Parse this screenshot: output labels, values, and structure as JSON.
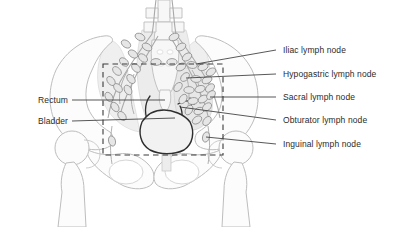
{
  "figure": {
    "type": "anatomical-illustration",
    "region": "male pelvis, anterior view"
  },
  "colors": {
    "bone_stroke": "#b9b9b9",
    "bone_fill": "#fbfbfb",
    "soft_tissue_fill": "#efefef",
    "soft_tissue_stroke": "#c8c8c8",
    "node_stroke": "#8f8f8f",
    "node_fill": "#e4e4e4",
    "vessel_stroke": "#a8a8a8",
    "bladder_stroke": "#2f2f2f",
    "dashed_box": "#3a3a3a",
    "leader_line": "#3a3a3a",
    "label_text": "#2b2b2b",
    "background": "#ffffff"
  },
  "labels_right": [
    {
      "id": "iliac",
      "text": "Iliac lymph node",
      "y": 50,
      "leader_from_x": 276,
      "leader_to_x": 196,
      "leader_to_y": 64
    },
    {
      "id": "hypogastric",
      "text": "Hypogastric lymph node",
      "y": 74,
      "leader_from_x": 276,
      "leader_to_x": 186,
      "leader_to_y": 78
    },
    {
      "id": "sacral",
      "text": "Sacral lymph node",
      "y": 97,
      "leader_from_x": 276,
      "leader_to_x": 210,
      "leader_to_y": 97
    },
    {
      "id": "obturator",
      "text": "Obturator lymph node",
      "y": 120,
      "leader_from_x": 276,
      "leader_to_x": 180,
      "leader_to_y": 107
    },
    {
      "id": "inguinal",
      "text": "Inguinal lymph node",
      "y": 144,
      "leader_from_x": 276,
      "leader_to_x": 206,
      "leader_to_y": 137
    }
  ],
  "labels_left": [
    {
      "id": "rectum",
      "text": "Rectum",
      "y": 100,
      "leader_from_x": 72,
      "leader_to_x": 165,
      "leader_to_y": 100
    },
    {
      "id": "bladder",
      "text": "Bladder",
      "y": 121,
      "leader_from_x": 72,
      "leader_to_x": 175,
      "leader_to_y": 118
    }
  ],
  "dashed_box": {
    "x": 103,
    "y": 64,
    "width": 120,
    "height": 91
  },
  "node_chains": {
    "left_external_iliac": [
      [
        126,
        44
      ],
      [
        131,
        52
      ],
      [
        122,
        60
      ],
      [
        116,
        69
      ],
      [
        110,
        78
      ],
      [
        116,
        86
      ],
      [
        108,
        96
      ],
      [
        113,
        105
      ],
      [
        120,
        114
      ]
    ],
    "left_common_iliac": [
      [
        140,
        36
      ],
      [
        146,
        45
      ],
      [
        150,
        56
      ],
      [
        143,
        66
      ],
      [
        136,
        76
      ],
      [
        130,
        86
      ]
    ],
    "right_common_iliac": [
      [
        174,
        36
      ],
      [
        180,
        46
      ],
      [
        186,
        56
      ],
      [
        192,
        64
      ]
    ],
    "right_cluster": [
      [
        180,
        68
      ],
      [
        189,
        64
      ],
      [
        197,
        70
      ],
      [
        204,
        64
      ],
      [
        186,
        76
      ],
      [
        196,
        80
      ],
      [
        206,
        76
      ],
      [
        212,
        70
      ],
      [
        178,
        86
      ],
      [
        188,
        90
      ],
      [
        198,
        88
      ],
      [
        208,
        86
      ],
      [
        182,
        98
      ],
      [
        192,
        100
      ],
      [
        202,
        98
      ],
      [
        210,
        94
      ],
      [
        188,
        108
      ],
      [
        198,
        110
      ],
      [
        206,
        106
      ],
      [
        196,
        118
      ],
      [
        206,
        120
      ]
    ],
    "inguinal": [
      [
        206,
        137
      ],
      [
        112,
        140
      ]
    ]
  }
}
